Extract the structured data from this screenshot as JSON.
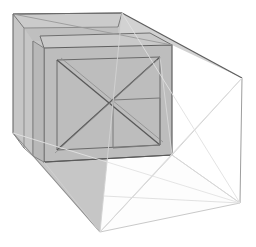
{
  "scene": {
    "title": "3D Box Wireframe Render",
    "description": "Shaded perspective wireframe of a nested rectangular enclosure with cross-bracing",
    "canvas": {
      "width": 256,
      "height": 247,
      "background": "#ffffff"
    },
    "palette": {
      "background": "#ffffff",
      "shaded_fill": "#c2c2c2",
      "shaded_fill_light": "#cccccc",
      "shaded_fill_dark": "#b4b4b4",
      "inner_fill": "#bdbdbd",
      "clear_fill": "#ffffff",
      "edge_dark": "#5a5a5a",
      "edge_mid": "#8c8c8c",
      "edge_light": "#cfcfcf",
      "edge_faint": "#e2e2e2"
    },
    "stroke_widths": {
      "outline": 1.1,
      "inner": 1.0,
      "brace": 1.0,
      "faint": 0.9
    },
    "vertices": {
      "outer_back_top_left": [
        13,
        14
      ],
      "outer_back_top_right": [
        122,
        13
      ],
      "outer_front_top_right": [
        242,
        78
      ],
      "outer_back_bottom_left": [
        13,
        133
      ],
      "outer_back_bottom_right": [
        100,
        232
      ],
      "outer_front_bottom_right": [
        240,
        203
      ],
      "outer_mid_top": [
        122,
        13
      ],
      "outer_mid_bottom": [
        100,
        232
      ],
      "inner_top_left": [
        44,
        48
      ],
      "inner_top_right": [
        172,
        45
      ],
      "inner_bottom_left": [
        44,
        162
      ],
      "inner_bottom_right": [
        172,
        155
      ],
      "brace_center": [
        108,
        103
      ],
      "front_hub": [
        172,
        155
      ]
    },
    "faces": [
      {
        "name": "outer-left-wall",
        "fill": "#c6c6c6"
      },
      {
        "name": "outer-top-face",
        "fill": "#cfcfcf"
      },
      {
        "name": "outer-floor-face",
        "fill": "#fdfdfd"
      },
      {
        "name": "inner-front-face",
        "fill": "#bdbdbd"
      },
      {
        "name": "inner-top-face",
        "fill": "#c9c9c9"
      },
      {
        "name": "front-open-face",
        "fill": "#ffffff"
      }
    ],
    "annotations": {
      "x_brace_label": "X-brace",
      "inner_box_label": "inner box",
      "outer_shell_label": "outer shell"
    }
  }
}
